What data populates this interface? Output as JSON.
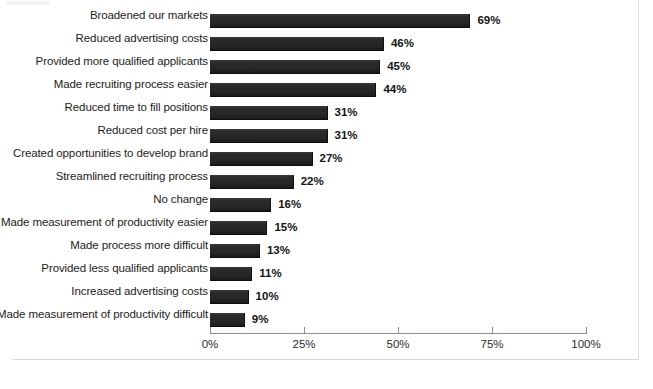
{
  "chart_data": {
    "type": "bar",
    "orientation": "horizontal",
    "title": "",
    "subtitle": "",
    "xlabel": "",
    "ylabel": "",
    "xlim": [
      0,
      100
    ],
    "grid": false,
    "legend": null,
    "value_suffix": "%",
    "categories": [
      "Broadened our markets",
      "Reduced advertising costs",
      "Provided more qualified applicants",
      "Made recruiting process easier",
      "Reduced time to fill positions",
      "Reduced cost per hire",
      "Created opportunities to develop brand",
      "Streamlined recruiting process",
      "No change",
      "Made measurement of productivity easier",
      "Made process more difficult",
      "Provided less qualified applicants",
      "Increased advertising costs",
      "Made measurement of productivity difficult"
    ],
    "values": [
      69,
      46,
      45,
      44,
      31,
      31,
      27,
      22,
      16,
      15,
      13,
      11,
      10,
      9
    ],
    "data_labels": [
      "69%",
      "46%",
      "45%",
      "44%",
      "31%",
      "31%",
      "27%",
      "22%",
      "16%",
      "15%",
      "13%",
      "11%",
      "10%",
      "9%"
    ],
    "xticks": [
      0,
      25,
      50,
      75,
      100
    ],
    "xtick_labels": [
      "0%",
      "25%",
      "50%",
      "75%",
      "100%"
    ],
    "bar_color": "#2b2b2b",
    "axis_color": "#8d8d8d",
    "text_color": "#1c1c1c"
  }
}
